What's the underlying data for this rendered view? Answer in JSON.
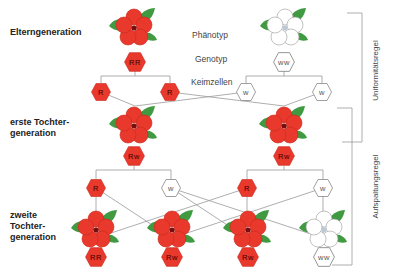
{
  "labels": {
    "parents": "Elterngeneration",
    "f1": "erste Tochter-\ngeneration",
    "f2": "zweite\nTochter-\ngeneration",
    "phenotype": "Phänotyp",
    "genotype": "Genotyp",
    "gametes": "Keimzellen",
    "uniformity_rule": "Uniformitätsregel",
    "segregation_rule": "Aufspaltungsregel"
  },
  "colors": {
    "red": "#e8392c",
    "white": "#ffffff",
    "leaf": "#3f9a42",
    "line": "#999999"
  },
  "parents": [
    {
      "phenotype": "red",
      "genotype": "RR",
      "gametes": [
        "R",
        "R"
      ]
    },
    {
      "phenotype": "white",
      "genotype": "ww",
      "gametes": [
        "w",
        "w"
      ]
    }
  ],
  "f1": [
    {
      "phenotype": "red",
      "genotype": "Rw",
      "gametes": [
        "R",
        "w"
      ]
    },
    {
      "phenotype": "red",
      "genotype": "Rw",
      "gametes": [
        "R",
        "w"
      ]
    }
  ],
  "f2": [
    {
      "phenotype": "red",
      "genotype": "RR"
    },
    {
      "phenotype": "red",
      "genotype": "Rw"
    },
    {
      "phenotype": "red",
      "genotype": "Rw"
    },
    {
      "phenotype": "white",
      "genotype": "ww"
    }
  ]
}
